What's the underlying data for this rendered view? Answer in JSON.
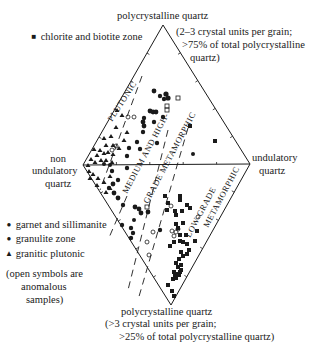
{
  "diagram": {
    "type": "ternary-diamond",
    "vertices": {
      "top": {
        "label": "polycrystalline quartz",
        "sublabel_lines": [
          "(2–3 crystal units per grain;",
          ">75% of total polycrystalline",
          "quartz)"
        ]
      },
      "left": {
        "label_lines": [
          "non",
          "undulatory",
          "quartz"
        ]
      },
      "right": {
        "label_lines": [
          "undulatory",
          "quartz"
        ]
      },
      "bottom": {
        "label": "polycrystalline quartz",
        "sublabel_lines": [
          "(>3 crystal units per grain;",
          ">25% of total polycrystalline quartz)"
        ]
      }
    },
    "fields": [
      {
        "name": "PLUTONIC"
      },
      {
        "name": "MEDIUM AND HIGH-"
      },
      {
        "name": "GRADE METAMORPHIC"
      },
      {
        "name": "LOW-GRADE"
      },
      {
        "name": "METAMORPHIC"
      }
    ],
    "legend": {
      "top_item": {
        "symbol": "■",
        "label": "chlorite and biotite zone"
      },
      "items": [
        {
          "symbol": "●",
          "label": "garnet and sillimanite"
        },
        {
          "symbol": "●",
          "label": "granulite zone"
        },
        {
          "symbol": "▲",
          "label": "granitic plutonic"
        }
      ],
      "note_lines": [
        "(open symbols are",
        "anomalous",
        "samples)"
      ]
    },
    "colors": {
      "ink": "#1a1a1a",
      "background": "#ffffff"
    }
  }
}
